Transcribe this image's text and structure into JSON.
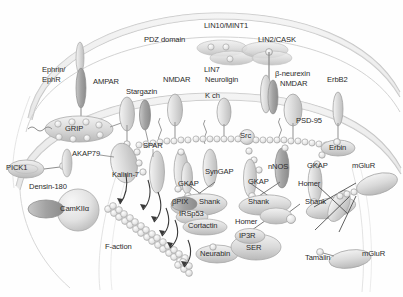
{
  "figure": {
    "type": "biological-schematic",
    "background_color": "#fefefe",
    "ink_color": "#2b2b2b",
    "membrane_color": "#cfcfcf",
    "protein_fill_light": "#e6e6e6",
    "protein_fill_mid": "#c9c9c9",
    "protein_fill_dark": "#9e9e9e"
  },
  "labels": {
    "pdz_domain": "PDZ domain",
    "lin10_mint1": "LIN10/MINT1",
    "lin7": "LIN7",
    "lin2_cask": "LIN2/CASK",
    "ephrin_ephr_line1": "Ephrin/",
    "ephrin_ephr_line2": "EphR",
    "ampar": "AMPAR",
    "stargazin": "Stargazin",
    "nmdar_left": "NMDAR",
    "neuroligin": "Neuroligin",
    "kch": "K ch",
    "beta_neurexin": "β-neurexin",
    "nmdar_right": "NMDAR",
    "erbb2": "ErbB2",
    "grip": "GRIP",
    "src": "Src",
    "psd95": "PSD-95",
    "akap79": "AKAP79",
    "spar": "SPAR",
    "erbin": "Erbin",
    "pick1": "PICK1",
    "kalirin7": "Kalirin-7",
    "syngap": "SynGAP",
    "nnos": "nNOS",
    "gkap_left": "GKAP",
    "gkap_mid": "GKAP",
    "gkap_right": "GKAP",
    "densin180": "Densin-180",
    "camkii": "CamKIIα",
    "homer_right": "Homer",
    "mglur_top": "mGluR",
    "mglur_bottom": "mGluR",
    "bpix": "βPIX",
    "shank_left": "Shank",
    "shank_mid": "Shank",
    "shank_right": "Shank",
    "irsp53": "IRSp53",
    "cortactin": "Cortactin",
    "homer_mid": "Homer",
    "ip3r": "IP3R",
    "ser": "SER",
    "neurabin": "Neurabin",
    "tamalin": "Tamalin",
    "f_actin": "F-action"
  },
  "structures": {
    "presynaptic_membrane": "curved bilayer across top",
    "postsynaptic_membrane": "curved bilayer across middle",
    "spine_outline": "dendritic spine neck outline lower left",
    "psd_chain": "beaded PSD-95 chain along postsynaptic membrane",
    "actin_filaments": "two beaded F-actin filaments",
    "arrows": "six curved arrows pointing toward F-actin"
  }
}
